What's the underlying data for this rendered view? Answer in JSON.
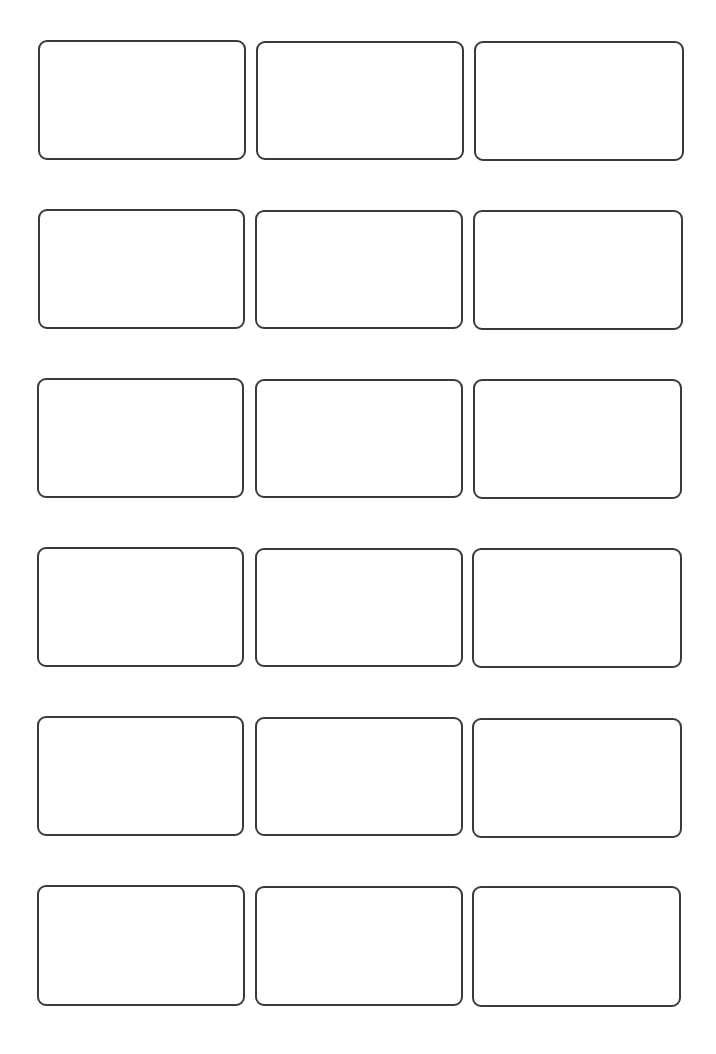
{
  "sheet": {
    "type": "label-template",
    "rows": 6,
    "columns": 3,
    "border_color": "#3a3a3a",
    "background_color": "#ffffff",
    "labels": [
      {
        "row": 1,
        "col": 1,
        "x": 38,
        "y": 40,
        "w": 208,
        "h": 120,
        "text": ""
      },
      {
        "row": 1,
        "col": 2,
        "x": 256,
        "y": 41,
        "w": 208,
        "h": 119,
        "text": ""
      },
      {
        "row": 1,
        "col": 3,
        "x": 474,
        "y": 41,
        "w": 210,
        "h": 120,
        "text": ""
      },
      {
        "row": 2,
        "col": 1,
        "x": 38,
        "y": 209,
        "w": 207,
        "h": 120,
        "text": ""
      },
      {
        "row": 2,
        "col": 2,
        "x": 255,
        "y": 210,
        "w": 208,
        "h": 119,
        "text": ""
      },
      {
        "row": 2,
        "col": 3,
        "x": 473,
        "y": 210,
        "w": 210,
        "h": 120,
        "text": ""
      },
      {
        "row": 3,
        "col": 1,
        "x": 37,
        "y": 378,
        "w": 207,
        "h": 120,
        "text": ""
      },
      {
        "row": 3,
        "col": 2,
        "x": 255,
        "y": 379,
        "w": 208,
        "h": 119,
        "text": ""
      },
      {
        "row": 3,
        "col": 3,
        "x": 473,
        "y": 379,
        "w": 209,
        "h": 120,
        "text": ""
      },
      {
        "row": 4,
        "col": 1,
        "x": 37,
        "y": 547,
        "w": 207,
        "h": 120,
        "text": ""
      },
      {
        "row": 4,
        "col": 2,
        "x": 255,
        "y": 548,
        "w": 208,
        "h": 119,
        "text": ""
      },
      {
        "row": 4,
        "col": 3,
        "x": 472,
        "y": 548,
        "w": 210,
        "h": 120,
        "text": ""
      },
      {
        "row": 5,
        "col": 1,
        "x": 37,
        "y": 716,
        "w": 207,
        "h": 120,
        "text": ""
      },
      {
        "row": 5,
        "col": 2,
        "x": 255,
        "y": 717,
        "w": 208,
        "h": 119,
        "text": ""
      },
      {
        "row": 5,
        "col": 3,
        "x": 472,
        "y": 718,
        "w": 210,
        "h": 120,
        "text": ""
      },
      {
        "row": 6,
        "col": 1,
        "x": 37,
        "y": 885,
        "w": 208,
        "h": 121,
        "text": ""
      },
      {
        "row": 6,
        "col": 2,
        "x": 255,
        "y": 886,
        "w": 208,
        "h": 120,
        "text": ""
      },
      {
        "row": 6,
        "col": 3,
        "x": 472,
        "y": 886,
        "w": 209,
        "h": 121,
        "text": ""
      }
    ]
  }
}
